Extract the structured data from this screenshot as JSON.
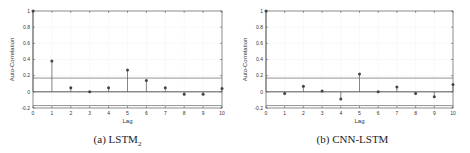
{
  "chart_data": [
    {
      "type": "stem",
      "title": "",
      "caption": "(a) LSTM",
      "caption_sub": "2",
      "xlabel": "Lag",
      "ylabel": "Auto-Correlation",
      "xlim": [
        0,
        10
      ],
      "ylim": [
        -0.2,
        1.0
      ],
      "xticks": [
        0,
        1,
        2,
        3,
        4,
        5,
        6,
        7,
        8,
        9,
        10
      ],
      "yticks": [
        -0.2,
        0,
        0.2,
        0.4,
        0.6,
        0.8,
        1
      ],
      "ytick_labels": [
        "-0.2",
        "0",
        "0.2",
        "0.4",
        "0.6",
        "0.8",
        "1"
      ],
      "grid": true,
      "x": [
        0,
        1,
        2,
        3,
        4,
        5,
        6,
        7,
        8,
        9,
        10
      ],
      "values": [
        1.0,
        0.38,
        0.05,
        0.0,
        0.05,
        0.27,
        0.14,
        0.05,
        -0.03,
        -0.03,
        0.04
      ],
      "confidence_bounds": [
        0.17,
        -0.17
      ]
    },
    {
      "type": "stem",
      "title": "",
      "caption": "(b) CNN-LSTM",
      "caption_sub": "",
      "xlabel": "Lag",
      "ylabel": "Auto-Correlation",
      "xlim": [
        0,
        10
      ],
      "ylim": [
        -0.2,
        1.0
      ],
      "xticks": [
        0,
        1,
        2,
        3,
        4,
        5,
        6,
        7,
        8,
        9,
        10
      ],
      "yticks": [
        -0.2,
        0,
        0.2,
        0.4,
        0.6,
        0.8,
        1
      ],
      "ytick_labels": [
        "-0.2",
        "0",
        "0.2",
        "0.4",
        "0.6",
        "0.8",
        "1"
      ],
      "grid": true,
      "x": [
        0,
        1,
        2,
        3,
        4,
        5,
        6,
        7,
        8,
        9,
        10
      ],
      "values": [
        1.0,
        -0.02,
        0.07,
        0.01,
        -0.09,
        0.22,
        0.0,
        0.06,
        -0.02,
        -0.06,
        0.09
      ],
      "confidence_bounds": [
        0.17,
        -0.17
      ]
    }
  ],
  "panels": [
    {
      "caption": "(a) LSTM",
      "caption_sub": "2",
      "xlabel": "Lag",
      "ylabel": "Auto-Correlation"
    },
    {
      "caption": "(b) CNN-LSTM",
      "caption_sub": "",
      "xlabel": "Lag",
      "ylabel": "Auto-Correlation"
    }
  ],
  "colors": {
    "stem": "#555555",
    "axis": "#444444",
    "grid": "#e4e4e4",
    "bound": "#666666",
    "marker": "#444444"
  }
}
